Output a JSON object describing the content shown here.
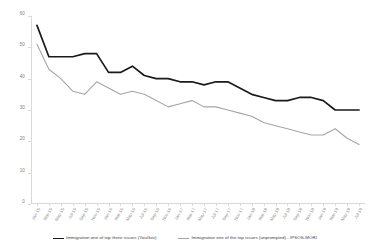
{
  "chart": {
    "type": "line",
    "title": "",
    "background_color": "#ffffff"
  },
  "axes": {
    "y": {
      "label": "",
      "min": 0,
      "max": 60,
      "ticks": [
        "60",
        "50",
        "40",
        "30",
        "20",
        "10",
        "0"
      ],
      "tick_values": [
        60,
        50,
        40,
        30,
        20,
        10,
        0
      ],
      "axis_color": "#d9d9d9",
      "label_color": "#808080"
    },
    "x": {
      "label": "",
      "axis_color": "#d9d9d9",
      "label_color": "#8a8a8a",
      "rotation_degrees": -60
    },
    "grid": "off"
  },
  "legend": {
    "position": "bottom-center",
    "entries": [
      {
        "label": "Immigration one of top three issues (YouGov)",
        "color": "#1a1a1a",
        "width": 1.6
      },
      {
        "label": "Immigration one of the top issues (unprompted) - IPSOS-MORI",
        "color": "#a6a6a6",
        "width": 1.1
      }
    ]
  },
  "chart_data": {
    "type": "line",
    "title": "",
    "xlabel": "",
    "ylabel": "",
    "ylim": [
      0,
      60
    ],
    "grid": false,
    "legend_position": "bottom-center",
    "categories": [
      "Jan-15",
      "Mar-15",
      "May-15",
      "Jul-15",
      "Sep-15",
      "Nov-15",
      "Jan-16",
      "Mar-16",
      "May-16",
      "Jul-16",
      "Sep-16",
      "Nov-16",
      "Jan-17",
      "Mar-17",
      "May-17",
      "Jul-17",
      "Sep-17",
      "Nov-17",
      "Jan-18",
      "Mar-18",
      "May-18",
      "Jul-18",
      "Sep-18",
      "Nov-18",
      "Jan-19",
      "Mar-19",
      "May-19",
      "Jul-19"
    ],
    "series": [
      {
        "name": "Immigration one of top three issues (YouGov)",
        "color": "#1a1a1a",
        "values": [
          57,
          47,
          47,
          47,
          48,
          48,
          42,
          42,
          44,
          41,
          40,
          40,
          39,
          39,
          38,
          39,
          39,
          37,
          35,
          34,
          33,
          33,
          34,
          34,
          33,
          30,
          30,
          30
        ]
      },
      {
        "name": "Immigration one of the top issues (unprompted) - IPSOS-MORI",
        "color": "#a6a6a6",
        "values": [
          51,
          43,
          40,
          36,
          35,
          39,
          37,
          35,
          36,
          35,
          33,
          31,
          32,
          33,
          31,
          31,
          30,
          29,
          28,
          26,
          25,
          24,
          23,
          22,
          22,
          24,
          21,
          19
        ]
      }
    ]
  }
}
